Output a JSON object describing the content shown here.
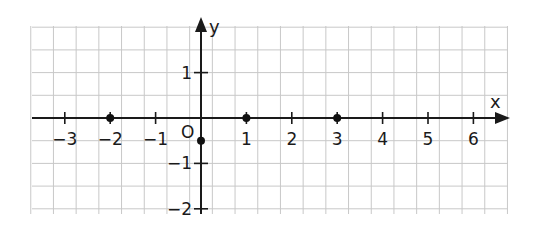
{
  "diagram": {
    "type": "coordinate-plane",
    "x_axis_label": "x",
    "y_axis_label": "y",
    "origin_label": "O",
    "x_ticks": [
      {
        "value": -3,
        "label": "−3"
      },
      {
        "value": -2,
        "label": "−2"
      },
      {
        "value": -1,
        "label": "−1"
      },
      {
        "value": 1,
        "label": "1"
      },
      {
        "value": 2,
        "label": "2"
      },
      {
        "value": 3,
        "label": "3"
      },
      {
        "value": 4,
        "label": "4"
      },
      {
        "value": 5,
        "label": "5"
      },
      {
        "value": 6,
        "label": "6"
      }
    ],
    "y_ticks": [
      {
        "value": 1,
        "label": "1"
      },
      {
        "value": -1,
        "label": "−1"
      },
      {
        "value": -2,
        "label": "−2"
      }
    ],
    "points": [
      {
        "x": -2,
        "y": 0
      },
      {
        "x": 1,
        "y": 0
      },
      {
        "x": 3,
        "y": 0
      },
      {
        "x": 0,
        "y": -0.5
      }
    ],
    "grid": {
      "cells_per_unit": 2,
      "x_range": [
        -3.75,
        6.75
      ],
      "y_range": [
        -2,
        2
      ]
    },
    "colors": {
      "grid": "#c8c8c8",
      "axis": "#1a1a1a",
      "point": "#111111"
    }
  }
}
